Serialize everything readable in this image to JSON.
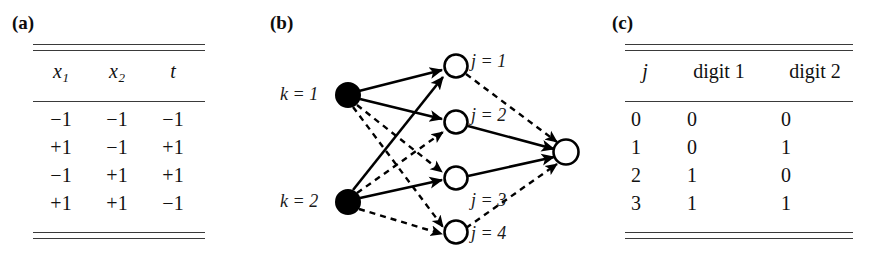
{
  "figure": {
    "panels": [
      {
        "id": "a",
        "letter": "(a)"
      },
      {
        "id": "b",
        "letter": "(b)"
      },
      {
        "id": "c",
        "letter": "(c)"
      }
    ]
  },
  "panel_a": {
    "letter": "(a)",
    "caption": "XOR truth table",
    "headers": [
      {
        "symbol": "x",
        "subscript": "1"
      },
      {
        "symbol": "x",
        "subscript": "2"
      },
      {
        "symbol": "t",
        "subscript": ""
      }
    ],
    "rows": [
      [
        "−1",
        "−1",
        "−1"
      ],
      [
        "+1",
        "−1",
        "+1"
      ],
      [
        "−1",
        "+1",
        "+1"
      ],
      [
        "+1",
        "+1",
        "−1"
      ]
    ]
  },
  "panel_b": {
    "letter": "(b)",
    "caption": "two-layer network diagram",
    "input_nodes": [
      {
        "id": "k1",
        "label": "k",
        "eq": " = ",
        "value": "1",
        "cx": 118,
        "cy": 95,
        "r": 12,
        "fill": "#000000"
      },
      {
        "id": "k2",
        "label": "k",
        "eq": " = ",
        "value": "2",
        "cx": 118,
        "cy": 202,
        "r": 12,
        "fill": "#000000"
      }
    ],
    "hidden_nodes": [
      {
        "id": "j1",
        "label": "j",
        "eq": " = ",
        "value": "1",
        "cx": 226,
        "cy": 66,
        "r": 12,
        "fill": "#ffffff"
      },
      {
        "id": "j2",
        "label": "j",
        "eq": " = ",
        "value": "2",
        "cx": 226,
        "cy": 122,
        "r": 12,
        "fill": "#ffffff"
      },
      {
        "id": "j3",
        "label": "j",
        "eq": " = ",
        "value": "3",
        "cx": 226,
        "cy": 178,
        "r": 12,
        "fill": "#ffffff"
      },
      {
        "id": "j4",
        "label": "j",
        "eq": " = ",
        "value": "4",
        "cx": 226,
        "cy": 232,
        "r": 12,
        "fill": "#ffffff"
      }
    ],
    "output_nodes": [
      {
        "id": "out",
        "cx": 336,
        "cy": 152,
        "r": 13,
        "fill": "#ffffff"
      }
    ],
    "edges": [
      {
        "from": "k1",
        "to": "j1",
        "style": "solid"
      },
      {
        "from": "k1",
        "to": "j2",
        "style": "solid"
      },
      {
        "from": "k1",
        "to": "j3",
        "style": "dashed"
      },
      {
        "from": "k1",
        "to": "j4",
        "style": "dashed"
      },
      {
        "from": "k2",
        "to": "j1",
        "style": "solid"
      },
      {
        "from": "k2",
        "to": "j2",
        "style": "dashed"
      },
      {
        "from": "k2",
        "to": "j3",
        "style": "solid"
      },
      {
        "from": "k2",
        "to": "j4",
        "style": "dashed"
      },
      {
        "from": "j1",
        "to": "out",
        "style": "dashed"
      },
      {
        "from": "j2",
        "to": "out",
        "style": "solid"
      },
      {
        "from": "j3",
        "to": "out",
        "style": "solid"
      },
      {
        "from": "j4",
        "to": "out",
        "style": "dashed"
      }
    ],
    "input_labels": [
      {
        "text": "k = 1"
      },
      {
        "text": "k = 2"
      }
    ],
    "hidden_labels": [
      {
        "text": "j = 1"
      },
      {
        "text": "j = 2"
      },
      {
        "text": "j = 3"
      },
      {
        "text": "j = 4"
      }
    ]
  },
  "panel_c": {
    "letter": "(c)",
    "caption": "binary encoding table",
    "headers": [
      "j",
      "digit 1",
      "digit 2"
    ],
    "rows": [
      [
        "0",
        "0",
        "0"
      ],
      [
        "1",
        "0",
        "1"
      ],
      [
        "2",
        "1",
        "0"
      ],
      [
        "3",
        "1",
        "1"
      ]
    ]
  },
  "colors": {
    "ink": "#111111",
    "rule": "#3a3a3a",
    "node_fill_input": "#000000",
    "node_fill_hidden": "#ffffff",
    "background": "#ffffff"
  }
}
